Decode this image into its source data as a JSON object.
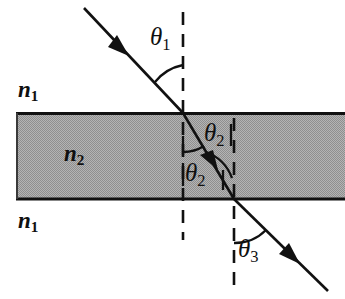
{
  "figure": {
    "type": "optics-ray-diagram",
    "width": 345,
    "height": 299,
    "background_color": "#ffffff"
  },
  "colors": {
    "slab_fill": "#a9a9a9",
    "line": "#111111",
    "text": "#101010",
    "page_background": "#ffffff"
  },
  "media": {
    "slab": {
      "index_label": "n",
      "index_subscript": "2",
      "fill_color": "#a9a9a9",
      "top_boundary_y": 113,
      "bottom_boundary_y": 199,
      "left_x": 16,
      "right_x": 345
    },
    "above": {
      "index_label": "n",
      "index_subscript": "1"
    },
    "below": {
      "index_label": "n",
      "index_subscript": "1"
    }
  },
  "labels": {
    "n1_top": {
      "base": "n",
      "sub": "1",
      "x": 18,
      "y": 78
    },
    "n2_middle": {
      "base": "n",
      "sub": "2",
      "x": 64,
      "y": 142
    },
    "n1_bottom": {
      "base": "n",
      "sub": "1",
      "x": 18,
      "y": 209
    },
    "theta1": {
      "base": "θ",
      "sub": "1",
      "x": 150,
      "y": 24
    },
    "theta2_upper": {
      "base": "θ",
      "sub": "2",
      "x": 204,
      "y": 120
    },
    "theta2_lower": {
      "base": "θ",
      "sub": "2",
      "x": 185,
      "y": 160
    },
    "theta3": {
      "base": "θ",
      "sub": "3",
      "x": 238,
      "y": 236
    }
  },
  "angles": [
    {
      "name": "theta1",
      "label": "θ1",
      "region": "incident-in-n1",
      "measured_from": "normal",
      "degrees": 46
    },
    {
      "name": "theta2-upper",
      "label": "θ2",
      "region": "refracted-in-n2-at-top-surface",
      "measured_from": "normal",
      "degrees": 31
    },
    {
      "name": "theta2-lower",
      "label": "θ2",
      "region": "incident-in-n2-at-bottom-surface",
      "measured_from": "normal",
      "degrees": 31
    },
    {
      "name": "theta3",
      "label": "θ3",
      "region": "transmitted-in-n1",
      "measured_from": "normal",
      "degrees": 45
    }
  ],
  "geometry": {
    "incident_ray": {
      "x1": 84,
      "y1": 8,
      "x2": 183,
      "y2": 113,
      "arrow_at": {
        "x": 122,
        "y": 49
      }
    },
    "slab_ray": {
      "x1": 183,
      "y1": 113,
      "x2": 234,
      "y2": 199,
      "arrow_at": {
        "x": 213,
        "y": 163
      }
    },
    "exit_ray": {
      "x1": 234,
      "y1": 199,
      "x2": 327,
      "y2": 290,
      "arrow_at": {
        "x": 293,
        "y": 257
      }
    },
    "normal_1": {
      "x": 183,
      "y1": 12,
      "y2": 240
    },
    "normal_2": {
      "x": 234,
      "y1": 118,
      "y2": 291
    }
  }
}
